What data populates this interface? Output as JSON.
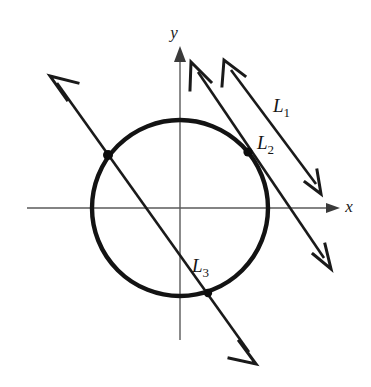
{
  "figure": {
    "background_color": "#ffffff",
    "ink_color": "#1a1a1a",
    "axis_color": "#5a5a5a",
    "width": 371,
    "height": 387
  },
  "axes": {
    "x_axis": {
      "label": "x",
      "label_position": {
        "x": 349,
        "y": 212
      },
      "start": {
        "x": 27,
        "y": 208
      },
      "end": {
        "x": 332,
        "y": 208
      },
      "arrow_tip": {
        "x": 340,
        "y": 208
      },
      "direction": "right"
    },
    "y_axis": {
      "label": "y",
      "label_position": {
        "x": 174,
        "y": 38
      },
      "start": {
        "x": 180,
        "y": 340
      },
      "end": {
        "x": 180,
        "y": 56
      },
      "arrow_tip": {
        "x": 180,
        "y": 46
      },
      "direction": "up"
    },
    "origin": {
      "x": 180,
      "y": 208
    }
  },
  "circle": {
    "name": "circle",
    "center": {
      "x": 180,
      "y": 208
    },
    "radius": 88,
    "stroke_color": "#131313",
    "stroke_width": 4.4,
    "fill": "none"
  },
  "lines": [
    {
      "id": "L1",
      "label": "L",
      "subscript": "1",
      "label_position": {
        "x": 273,
        "y": 112
      },
      "start": {
        "x": 224,
        "y": 60
      },
      "end": {
        "x": 322,
        "y": 193
      },
      "arrow_start": true,
      "arrow_end": true,
      "relation_to_circle": "external",
      "touch_point": null
    },
    {
      "id": "L2",
      "label": "L",
      "subscript": "2",
      "label_position": {
        "x": 257,
        "y": 149
      },
      "start": {
        "x": 191,
        "y": 62
      },
      "end": {
        "x": 330,
        "y": 267
      },
      "arrow_start": true,
      "arrow_end": true,
      "relation_to_circle": "tangent",
      "touch_point": {
        "x": 248,
        "y": 152
      }
    },
    {
      "id": "L3",
      "label": "L",
      "subscript": "3",
      "label_position": {
        "x": 192,
        "y": 272
      },
      "start": {
        "x": 50,
        "y": 76
      },
      "end": {
        "x": 255,
        "y": 361
      },
      "arrow_start": true,
      "arrow_end": true,
      "relation_to_circle": "secant",
      "touch_point": {
        "x": 108,
        "y": 155
      },
      "second_point": {
        "x": 208,
        "y": 293
      }
    }
  ],
  "marked_points": [
    {
      "name": "intersection-upper-left",
      "x": 108,
      "y": 155,
      "radius": 5.0
    },
    {
      "name": "tangent-point-L2",
      "x": 248,
      "y": 152,
      "radius": 4.6
    },
    {
      "name": "intersection-lower",
      "x": 208,
      "y": 293,
      "radius": 4.2
    }
  ]
}
